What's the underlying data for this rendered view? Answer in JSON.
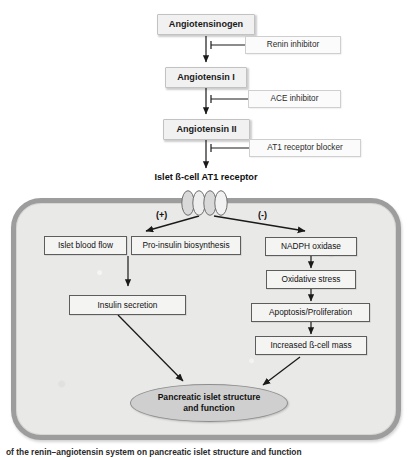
{
  "figure": {
    "caption": "of the renin–angiotensin system on pancreatic islet structure and function"
  },
  "cascade": {
    "nodes": [
      {
        "id": "angiotensinogen",
        "label": "Angiotensinogen"
      },
      {
        "id": "angiotensin-i",
        "label": "Angiotensin I"
      },
      {
        "id": "angiotensin-ii",
        "label": "Angiotensin II"
      }
    ],
    "inhibitors": [
      {
        "id": "renin-inhibitor",
        "label": "Renin inhibitor"
      },
      {
        "id": "ace-inhibitor",
        "label": "ACE inhibitor"
      },
      {
        "id": "at1-blocker",
        "label": "AT1 receptor blocker"
      }
    ]
  },
  "receptor": {
    "label": "Islet ß-cell AT1 receptor",
    "helix_count": 4,
    "icon": "gpcr-receptor-icon"
  },
  "branches": {
    "positive_sign": "(+)",
    "negative_sign": "(-)"
  },
  "cell": {
    "positive_pathway": [
      {
        "id": "islet-blood-flow",
        "label": "Islet blood flow"
      },
      {
        "id": "pro-insulin-biosynthesis",
        "label": "Pro-insulin biosynthesis"
      },
      {
        "id": "insulin-secretion",
        "label": "Insulin secretion"
      }
    ],
    "negative_pathway": [
      {
        "id": "nadph-oxidase",
        "label": "NADPH oxidase"
      },
      {
        "id": "oxidative-stress",
        "label": "Oxidative stress"
      },
      {
        "id": "apoptosis-proliferation",
        "label": "Apoptosis/Proliferation"
      },
      {
        "id": "increased-bcell-mass",
        "label": "Increased ß-cell mass"
      }
    ],
    "outcome": {
      "id": "pancreatic-islet-outcome",
      "line1": "Pancreatic islet structure",
      "line2": "and function"
    }
  },
  "colors": {
    "membrane": "#9d9d9d",
    "cytoplasm": "#e9e9e7",
    "node_fill": "#f1f1f1",
    "outcome_fill": "#cfcfcf",
    "stroke": "#1a1a1a"
  }
}
